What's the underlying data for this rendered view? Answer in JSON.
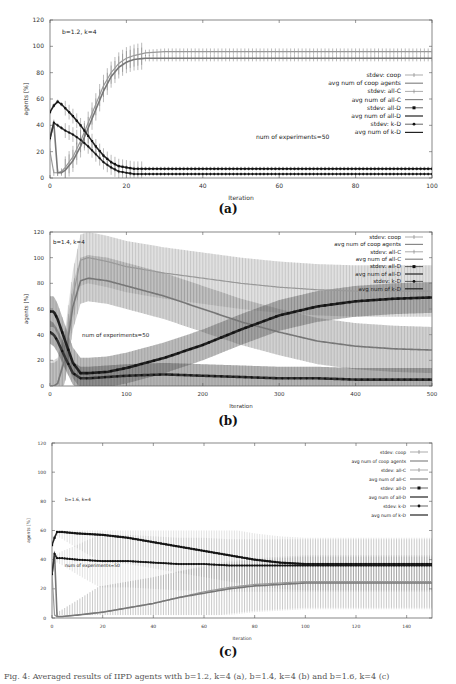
{
  "page": {
    "caption": "Fig. 4: Averaged results of IIPD agents with b=1.2, k=4 (a), b=1.4, k=4 (b) and b=1.6, k=4 (c)"
  },
  "legend_entries": [
    {
      "label": "stdev: coop",
      "style": "stdev",
      "marker": "plus"
    },
    {
      "label": "avg num of coop agents",
      "style": "line"
    },
    {
      "label": "stdev: all-C",
      "style": "stdev",
      "marker": "plus"
    },
    {
      "label": "avg num of all-C",
      "style": "line"
    },
    {
      "label": "stdev: all-D",
      "style": "stdev",
      "marker": "square"
    },
    {
      "label": "avg num of all-D",
      "style": "line"
    },
    {
      "label": "stdev: k-D",
      "style": "stdev",
      "marker": "diamond"
    },
    {
      "label": "avg num of k-D",
      "style": "line"
    }
  ],
  "chart_data": [
    {
      "id": "a",
      "sublabel": "(a)",
      "type": "line",
      "title": "",
      "annotation_params": "b=1.2, k=4",
      "annotation_experiments": "num of experiments=50",
      "xlabel": "iteration",
      "ylabel": "agents [%]",
      "xlim": [
        0,
        100
      ],
      "ylim": [
        0,
        120
      ],
      "xticks": [
        0,
        20,
        40,
        60,
        80,
        100
      ],
      "yticks": [
        0,
        20,
        40,
        60,
        80,
        100,
        120
      ],
      "legend_position": "right-middle",
      "x": [
        0,
        1,
        2,
        3,
        4,
        6,
        8,
        10,
        12,
        14,
        16,
        18,
        20,
        22,
        25,
        30,
        40,
        60,
        80,
        100
      ],
      "series": [
        {
          "name": "avg num of coop agents",
          "values": [
            20,
            4,
            4,
            5,
            8,
            16,
            28,
            42,
            56,
            70,
            80,
            87,
            91,
            93,
            95,
            96,
            96,
            96,
            96,
            96
          ],
          "stdev": 6
        },
        {
          "name": "avg num of all-C",
          "values": [
            30,
            42,
            4,
            4,
            6,
            13,
            24,
            38,
            52,
            66,
            77,
            84,
            88,
            90,
            91,
            91,
            91,
            91,
            91,
            91
          ],
          "stdev": 6
        },
        {
          "name": "avg num of all-D",
          "values": [
            50,
            55,
            58,
            56,
            53,
            47,
            40,
            32,
            24,
            17,
            12,
            9,
            8,
            7,
            7,
            7,
            7,
            7,
            7,
            7
          ],
          "stdev": 4
        },
        {
          "name": "avg num of k-D",
          "values": [
            30,
            42,
            40,
            38,
            36,
            33,
            29,
            24,
            18,
            12,
            8,
            5,
            4,
            3,
            3,
            3,
            3,
            3,
            3,
            3
          ],
          "stdev": 4
        }
      ]
    },
    {
      "id": "b",
      "sublabel": "(b)",
      "type": "line",
      "title": "",
      "annotation_params": "b=1.4, k=4",
      "annotation_experiments": "num of experiments=50",
      "xlabel": "iteration",
      "ylabel": "agents [%]",
      "xlim": [
        0,
        500
      ],
      "ylim": [
        0,
        120
      ],
      "xticks": [
        0,
        100,
        200,
        300,
        400,
        500
      ],
      "yticks": [
        0,
        20,
        40,
        60,
        80,
        100,
        120
      ],
      "legend_position": "top-right",
      "x": [
        0,
        5,
        10,
        20,
        30,
        40,
        50,
        75,
        100,
        150,
        200,
        250,
        300,
        350,
        400,
        450,
        500
      ],
      "series": [
        {
          "name": "avg num of coop agents",
          "values": [
            0,
            0,
            2,
            25,
            70,
            98,
            100,
            97,
            93,
            88,
            84,
            80,
            77,
            75,
            74,
            74,
            74
          ],
          "stdev": 20
        },
        {
          "name": "avg num of all-C",
          "values": [
            0,
            0,
            2,
            22,
            62,
            82,
            84,
            82,
            78,
            70,
            60,
            50,
            42,
            35,
            31,
            29,
            28
          ],
          "stdev": 18
        },
        {
          "name": "avg num of all-D",
          "values": [
            58,
            58,
            52,
            35,
            18,
            10,
            10,
            11,
            14,
            22,
            32,
            44,
            55,
            62,
            66,
            68,
            69
          ],
          "stdev": 12
        },
        {
          "name": "avg num of k-D",
          "values": [
            42,
            40,
            35,
            22,
            10,
            6,
            6,
            7,
            8,
            9,
            8,
            7,
            6,
            6,
            5,
            5,
            5
          ],
          "stdev": 9
        }
      ]
    },
    {
      "id": "c",
      "sublabel": "(c)",
      "type": "line",
      "title": "",
      "annotation_params": "b=1.6, k=4",
      "annotation_experiments": "num of experiments=50",
      "xlabel": "iteration",
      "ylabel": "agents [%]",
      "xlim": [
        0,
        150
      ],
      "ylim": [
        0,
        120
      ],
      "xticks": [
        0,
        20,
        40,
        60,
        80,
        100,
        120,
        140
      ],
      "yticks": [
        0,
        20,
        40,
        60,
        80,
        100,
        120
      ],
      "legend_position": "top-right",
      "x": [
        0,
        1,
        2,
        4,
        10,
        20,
        30,
        40,
        50,
        60,
        70,
        80,
        90,
        100,
        110,
        120,
        130,
        140,
        150
      ],
      "series": [
        {
          "name": "avg num of coop agents",
          "values": [
            30,
            2,
            1,
            1,
            2,
            4,
            7,
            10,
            14,
            18,
            21,
            23,
            24,
            25,
            25,
            25,
            25,
            25,
            25
          ],
          "stdev": 30
        },
        {
          "name": "avg num of all-C",
          "values": [
            30,
            44,
            1,
            1,
            2,
            4,
            7,
            10,
            14,
            17,
            20,
            22,
            23,
            24,
            24,
            24,
            24,
            24,
            24
          ],
          "stdev": 30
        },
        {
          "name": "avg num of all-D",
          "values": [
            50,
            55,
            59,
            59,
            58,
            57,
            55,
            52,
            49,
            46,
            43,
            40,
            38,
            37,
            37,
            37,
            37,
            37,
            37
          ],
          "stdev": 30
        },
        {
          "name": "avg num of k-D",
          "values": [
            30,
            44,
            41,
            41,
            40,
            39,
            39,
            38,
            37,
            37,
            36,
            36,
            36,
            36,
            36,
            36,
            36,
            36,
            36
          ],
          "stdev": 30
        }
      ]
    }
  ]
}
